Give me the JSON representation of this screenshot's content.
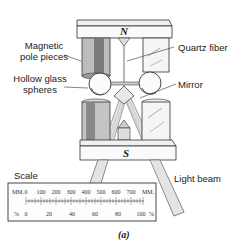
{
  "figure": {
    "caption": "(a)",
    "poles": {
      "north": "N",
      "south": "S"
    },
    "labels": {
      "magnetic_pole_pieces": "Magnetic\npole pieces",
      "magnetic_line1": "Magnetic",
      "magnetic_line2": "pole pieces",
      "hollow_line1": "Hollow glass",
      "hollow_line2": "spheres",
      "quartz_fiber": "Quartz fiber",
      "mirror": "Mirror",
      "scale": "Scale",
      "light_beam": "Light beam"
    },
    "scale": {
      "top_unit_left": "MM.",
      "top_unit_right": "MM.",
      "top_ticks": [
        "0",
        "100",
        "200",
        "300",
        "400",
        "500",
        "600",
        "700"
      ],
      "bottom_unit_left": "%",
      "bottom_unit_right": "%",
      "bottom_ticks": [
        "0",
        "20",
        "40",
        "60",
        "80",
        "100"
      ]
    }
  }
}
